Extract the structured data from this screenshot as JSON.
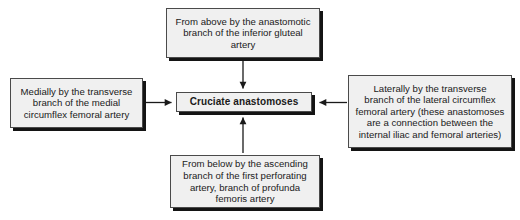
{
  "diagram": {
    "title": "Cruciate anastomoses",
    "background_color": "#ffffff",
    "box_fill_color": "#f0f0f0",
    "box_border_color": "#4a4a4a",
    "shadow_color": "#141414",
    "connector_color": "#1a1a1a",
    "center": {
      "label": "Cruciate anastomoses"
    },
    "nodes": {
      "top": {
        "label": "From above by the anastomotic\nbranch of the inferior gluteal\nartery",
        "direction": "down"
      },
      "left": {
        "label": "Medially by the transverse\nbranch of the medial\ncircumflex femoral artery",
        "direction": "right"
      },
      "right": {
        "label": "Laterally by the transverse\nbranch of the lateral circumflex\nfemoral artery (these anastomoses\nare a connection between the\ninternal iliac and femoral arteries)",
        "direction": "left"
      },
      "bottom": {
        "label": "From below by the ascending\nbranch of  the first perforating\nartery, branch of profunda\nfemoris artery",
        "direction": "up"
      }
    }
  }
}
